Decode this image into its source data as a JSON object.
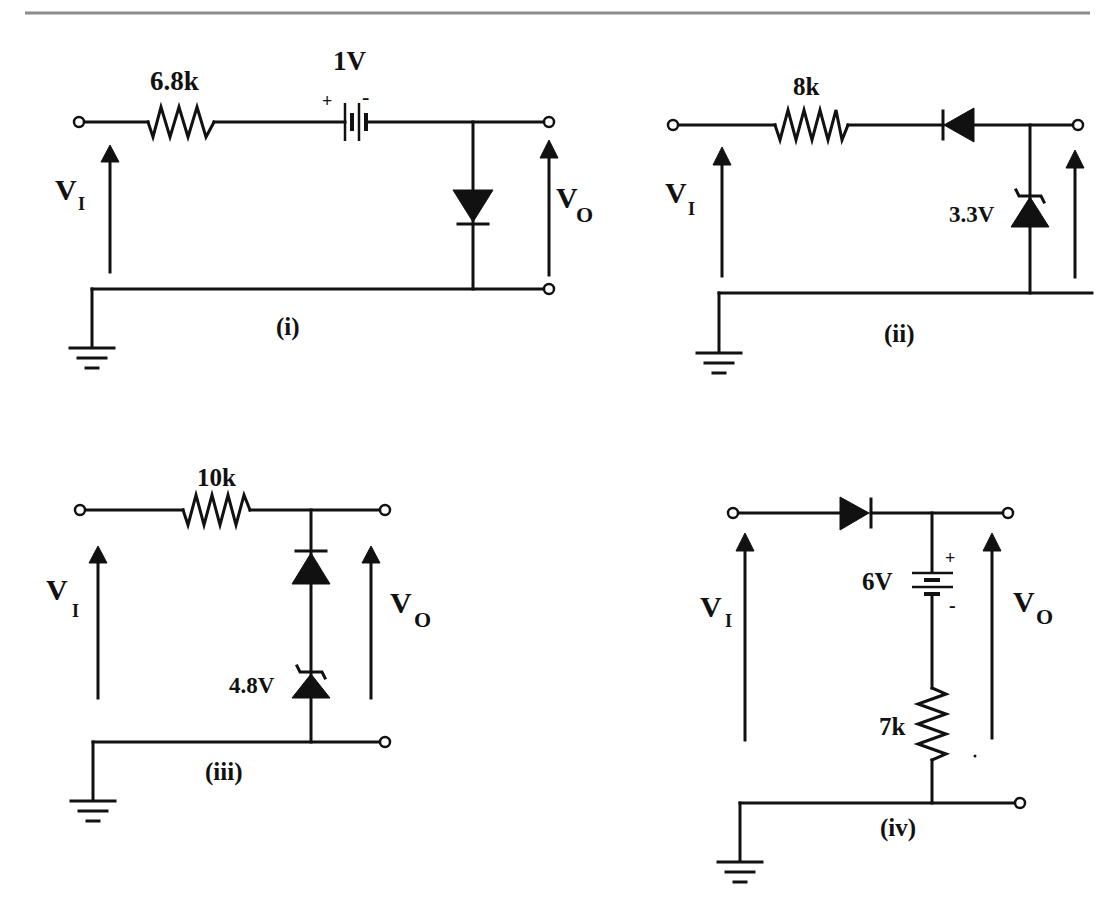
{
  "figure": {
    "rule_color": "#8c8c8c",
    "ink_color": "#111111",
    "circuits": [
      {
        "id": "i",
        "caption": "(i)",
        "input_label": "V",
        "input_sub": "I",
        "output_label": "V",
        "output_sub": "O",
        "resistor": "6.8k",
        "battery": "1V",
        "battery_plus": "+",
        "battery_minus": "-",
        "components": [
          "resistor 6.8k (series)",
          "battery 1V (series, + left)",
          "diode (shunt, cathode to ground)"
        ]
      },
      {
        "id": "ii",
        "caption": "(ii)",
        "input_label": "V",
        "input_sub": "I",
        "resistor": "8k",
        "zener": "3.3V",
        "components": [
          "resistor 8k (series)",
          "diode (series, cathode toward input)",
          "zener 3.3V (shunt, cathode to output)"
        ]
      },
      {
        "id": "iii",
        "caption": "(iii)",
        "input_label": "V",
        "input_sub": "I",
        "output_label": "V",
        "output_sub": "O",
        "resistor": "10k",
        "zener": "4.8V",
        "components": [
          "resistor 10k (series)",
          "diode (shunt, cathode to output)",
          "zener 4.8V (shunt, in series with diode)"
        ]
      },
      {
        "id": "iv",
        "caption": "(iv)",
        "input_label": "V",
        "input_sub": "I",
        "output_label": "V",
        "output_sub": "O",
        "resistor": "7k",
        "battery": "6V",
        "battery_plus": "+",
        "battery_minus": "-",
        "components": [
          "diode (series, anode at input)",
          "battery 6V (shunt, + on top)",
          "resistor 7k (shunt, to ground)"
        ]
      }
    ]
  }
}
